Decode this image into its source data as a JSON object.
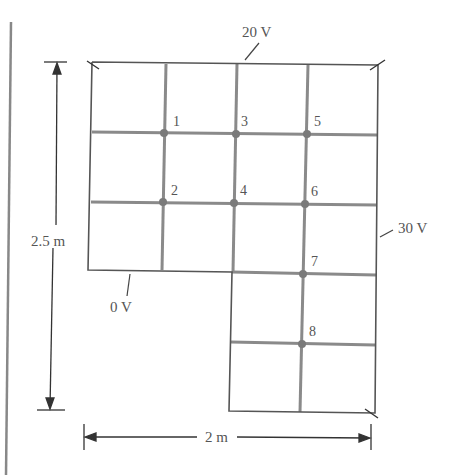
{
  "diagram": {
    "type": "finite-difference grid",
    "boundary_labels": {
      "top": "20 V",
      "right": "30 V",
      "bottom": "0 V"
    },
    "dimensions": {
      "height": "2.5 m",
      "width": "2 m"
    },
    "nodes": [
      {
        "id": "1",
        "label": "1"
      },
      {
        "id": "2",
        "label": "2"
      },
      {
        "id": "3",
        "label": "3"
      },
      {
        "id": "4",
        "label": "4"
      },
      {
        "id": "5",
        "label": "5"
      },
      {
        "id": "6",
        "label": "6"
      },
      {
        "id": "7",
        "label": "7"
      },
      {
        "id": "8",
        "label": "8"
      }
    ],
    "colors": {
      "inner_lines": "#8a8a8a",
      "outer_lines": "#555555",
      "node_dots": "#7a7a7a"
    }
  }
}
